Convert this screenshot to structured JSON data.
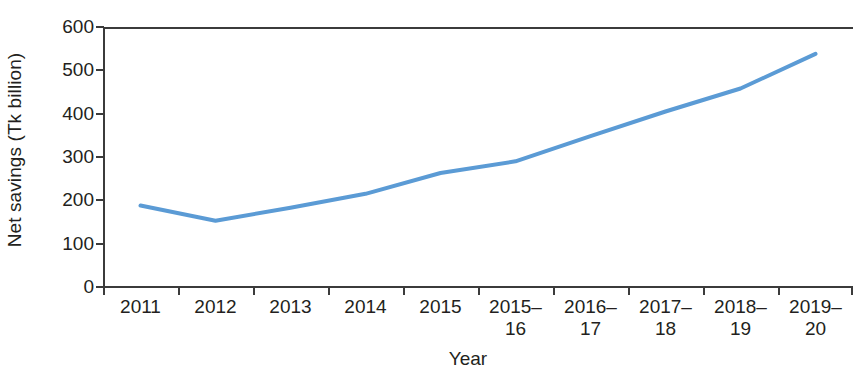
{
  "chart_data": {
    "type": "line",
    "title": "",
    "xlabel": "Year",
    "ylabel": "Net savings (Tk billion)",
    "categories": [
      "2011",
      "2012",
      "2013",
      "2014",
      "2015",
      "2015–16",
      "2016–17",
      "2017–18",
      "2018–19",
      "2019–20"
    ],
    "values": [
      188,
      153,
      183,
      215,
      263,
      290,
      348,
      405,
      458,
      538
    ],
    "series": [
      {
        "name": "Net savings",
        "values": [
          188,
          153,
          183,
          215,
          263,
          290,
          348,
          405,
          458,
          538
        ]
      }
    ],
    "ylim": [
      0,
      600
    ],
    "ytick_values": [
      0,
      100,
      200,
      300,
      400,
      500,
      600
    ],
    "ytick_labels": [
      "0",
      "100",
      "200",
      "300",
      "400",
      "500",
      "600"
    ],
    "grid": false,
    "legend": false,
    "legend_position": "none",
    "line_color": "#5b9bd5",
    "axis_color": "#3b3b3b",
    "text_color": "#231f20",
    "background": "#ffffff",
    "markers": false,
    "line_width": 4
  }
}
